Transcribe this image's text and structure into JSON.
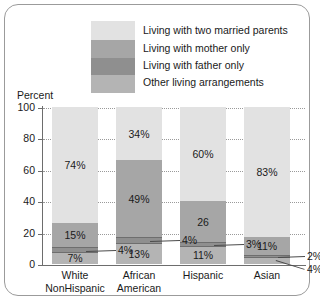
{
  "chart_data": {
    "type": "bar",
    "subtype": "stacked-bar",
    "title": "",
    "xlabel": "",
    "ylabel": "Percent",
    "ylim": [
      0,
      100
    ],
    "yticks": [
      0,
      20,
      40,
      60,
      80,
      100
    ],
    "grid": true,
    "grid_style": "dotted",
    "legend_position": "top-center",
    "categories": [
      "White NonHispanic",
      "African American",
      "Hispanic",
      "Asian"
    ],
    "category_lines": [
      [
        "White",
        "NonHispanic"
      ],
      [
        "African",
        "American"
      ],
      [
        "Hispanic",
        ""
      ],
      [
        "Asian",
        ""
      ]
    ],
    "series": [
      {
        "name": "Living with two married parents",
        "color": "#e2e2e2",
        "values": [
          74,
          34,
          60,
          83
        ],
        "labels": [
          "74%",
          "34%",
          "60%",
          "83%"
        ]
      },
      {
        "name": "Living with mother only",
        "color": "#a6a6a6",
        "values": [
          15,
          49,
          26,
          11
        ],
        "labels": [
          "15%",
          "49%",
          "26",
          "11%"
        ]
      },
      {
        "name": "Living with father only",
        "color": "#8f8f8f",
        "values": [
          4,
          4,
          3,
          2
        ],
        "labels": [
          "4%",
          "4%",
          "3%",
          "2%"
        ],
        "label_placement": "outside"
      },
      {
        "name": "Other living arrangements",
        "color": "#b4b4b4",
        "values": [
          7,
          13,
          11,
          4
        ],
        "labels": [
          "7%",
          "13%",
          "11%",
          "4%"
        ]
      }
    ]
  },
  "legend": {
    "items": [
      {
        "label": "Living with two married parents",
        "color": "#e2e2e2"
      },
      {
        "label": "Living with mother only",
        "color": "#a6a6a6"
      },
      {
        "label": "Living with father only",
        "color": "#8f8f8f"
      },
      {
        "label": "Other living arrangements",
        "color": "#b4b4b4"
      }
    ]
  },
  "axis": {
    "y_title": "Percent",
    "y_ticks": [
      "100",
      "80",
      "60",
      "40",
      "20",
      "0"
    ]
  }
}
